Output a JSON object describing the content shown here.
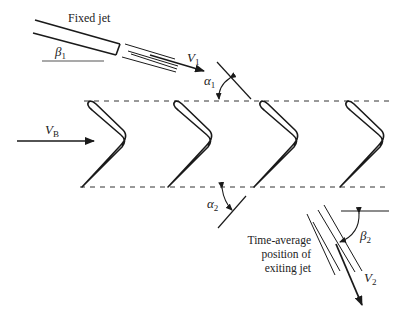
{
  "labels": {
    "fixed_jet": "Fixed jet",
    "beta1": "β",
    "beta1_sub": "1",
    "v1": "V",
    "v1_sub": "1",
    "alpha1": "α",
    "alpha1_sub": "1",
    "vb": "V",
    "vb_sub": "B",
    "alpha2": "α",
    "alpha2_sub": "2",
    "beta2": "β",
    "beta2_sub": "2",
    "v2": "V",
    "v2_sub": "2",
    "exit_line1": "Time-average",
    "exit_line2": "position of",
    "exit_line3": "exiting jet"
  },
  "blades": {
    "count": 4,
    "spacing_px": 86
  },
  "colors": {
    "stroke": "#1a1a1a",
    "background": "#ffffff"
  }
}
